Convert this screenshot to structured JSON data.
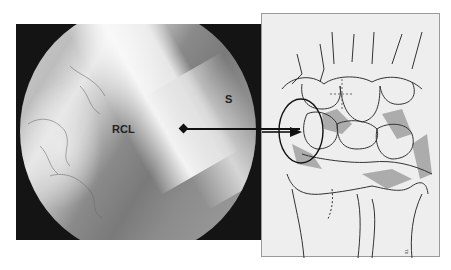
{
  "figure": {
    "left_panel": {
      "type": "arthroscopic-photo",
      "labels": [
        {
          "id": "rcl",
          "text": "RCL"
        },
        {
          "id": "s",
          "text": "S"
        }
      ]
    },
    "right_panel": {
      "type": "wrist-anatomy-line-drawing",
      "signature": "ILL"
    },
    "colors": {
      "background": "#ffffff",
      "photo_frame": "#141414",
      "drawing_bg": "#eeeeee",
      "drawing_line": "#333333",
      "drawing_shade": "#9c9c9c",
      "leader": "#111111"
    }
  }
}
